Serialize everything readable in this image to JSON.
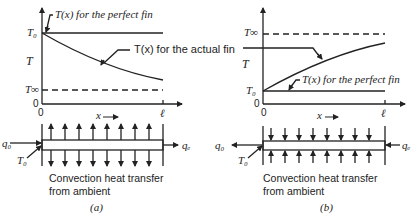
{
  "panel_a": {
    "perfect_label": "T(x) for the perfect fin",
    "actual_label": "T(x) for the actual fin",
    "T0": "T₀",
    "Tinf": "T∞",
    "T": "T",
    "zero_y": "0",
    "zero_x": "0",
    "x_label": "x",
    "ell": "ℓ",
    "q0": "q₀",
    "qe": "qₑ",
    "T0_fin": "T₀",
    "caption_line1": "Convection heat transfer",
    "caption_line2": "from ambient",
    "panel_label": "(a)"
  },
  "panel_b": {
    "perfect_label": "T(x) for the perfect fin",
    "T0": "T₀",
    "Tinf": "T∞",
    "T": "T",
    "zero_y": "0",
    "zero_x": "0",
    "x_label": "x",
    "ell": "ℓ",
    "q0": "q₀",
    "qe": "qₑ",
    "T0_fin": "T₀",
    "caption_line1": "Convection heat transfer",
    "caption_line2": "from ambient",
    "panel_label": "(b)"
  }
}
